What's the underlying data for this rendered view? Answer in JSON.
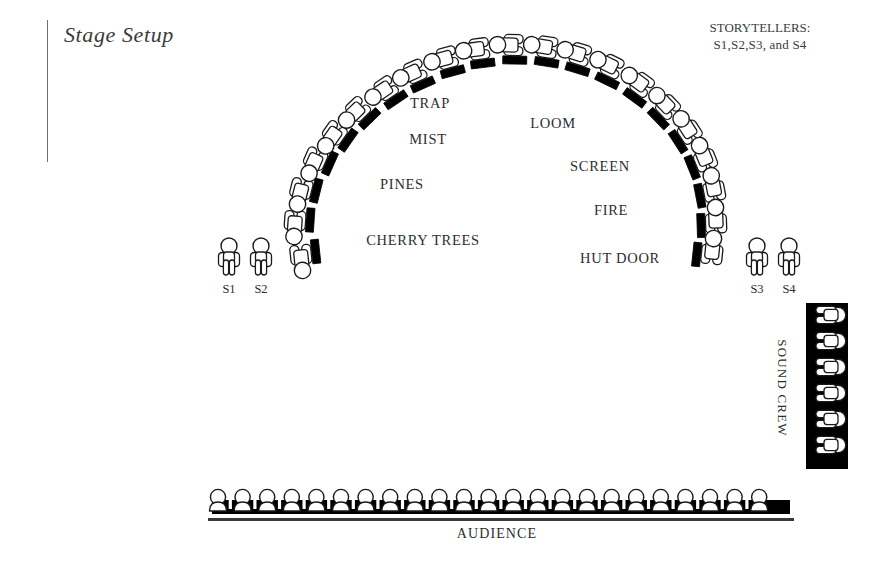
{
  "page": {
    "title": "Stage Setup",
    "background_color": "#ffffff",
    "width": 893,
    "height": 576
  },
  "header": {
    "title": "Stage Setup",
    "rule_color": "#6e6e6e"
  },
  "legend": {
    "storytellers_heading": "STORYTELLERS:",
    "storytellers_names": "S1,S2,S3, and S4"
  },
  "stage_labels": [
    {
      "id": "trap",
      "text": "TRAP",
      "x": 430,
      "y": 103
    },
    {
      "id": "loom",
      "text": "LOOM",
      "x": 553,
      "y": 123
    },
    {
      "id": "mist",
      "text": "MIST",
      "x": 428,
      "y": 139
    },
    {
      "id": "screen",
      "text": "SCREEN",
      "x": 600,
      "y": 166
    },
    {
      "id": "pines",
      "text": "PINES",
      "x": 402,
      "y": 184
    },
    {
      "id": "fire",
      "text": "FIRE",
      "x": 611,
      "y": 210
    },
    {
      "id": "cherry-trees",
      "text": "CHERRY TREES",
      "x": 423,
      "y": 240
    },
    {
      "id": "hut-door",
      "text": "HUT DOOR",
      "x": 620,
      "y": 258
    }
  ],
  "storyteller_markers": [
    {
      "id": "s1",
      "text": "S1",
      "x": 229,
      "y": 282
    },
    {
      "id": "s2",
      "text": "S2",
      "x": 261,
      "y": 282
    },
    {
      "id": "s3",
      "text": "S3",
      "x": 757,
      "y": 282
    },
    {
      "id": "s4",
      "text": "S4",
      "x": 789,
      "y": 282
    }
  ],
  "groups": {
    "audience": {
      "label": "AUDIENCE",
      "count": 23,
      "bench_color": "#000000",
      "figure_fill": "#ffffff",
      "outline_color": "#1a1a1a"
    },
    "sound_crew": {
      "label": "SOUND CREW",
      "count": 6,
      "panel_color": "#000000"
    },
    "performer_arc": {
      "count": 22,
      "description": "semicircular arc of seated performers"
    },
    "standing_storytellers": {
      "count": 4,
      "labels": [
        "S1",
        "S2",
        "S3",
        "S4"
      ]
    }
  },
  "arc_figures": [
    {
      "cx": 301,
      "cy": 256,
      "rot": -96
    },
    {
      "cx": 295,
      "cy": 222,
      "rot": -86
    },
    {
      "cx": 301,
      "cy": 190,
      "rot": -76
    },
    {
      "cx": 315,
      "cy": 160,
      "rot": -66
    },
    {
      "cx": 334,
      "cy": 134,
      "rot": -55
    },
    {
      "cx": 357,
      "cy": 110,
      "rot": -44
    },
    {
      "cx": 385,
      "cy": 89,
      "rot": -34
    },
    {
      "cx": 414,
      "cy": 72,
      "rot": -24
    },
    {
      "cx": 446,
      "cy": 58,
      "rot": -15
    },
    {
      "cx": 478,
      "cy": 49,
      "rot": -7
    },
    {
      "cx": 512,
      "cy": 45,
      "rot": 1
    },
    {
      "cx": 546,
      "cy": 47,
      "rot": 9
    },
    {
      "cx": 579,
      "cy": 54,
      "rot": 17
    },
    {
      "cx": 611,
      "cy": 66,
      "rot": 26
    },
    {
      "cx": 641,
      "cy": 84,
      "rot": 36
    },
    {
      "cx": 667,
      "cy": 106,
      "rot": 46
    },
    {
      "cx": 689,
      "cy": 131,
      "rot": 57
    },
    {
      "cx": 705,
      "cy": 159,
      "rot": 68
    },
    {
      "cx": 714,
      "cy": 190,
      "rot": 79
    },
    {
      "cx": 716,
      "cy": 222,
      "rot": 88
    },
    {
      "cx": 712,
      "cy": 253,
      "rot": 96
    }
  ],
  "standing_figures": [
    {
      "cx": 229,
      "cy": 258
    },
    {
      "cx": 261,
      "cy": 258
    },
    {
      "cx": 757,
      "cy": 258
    },
    {
      "cx": 789,
      "cy": 258
    }
  ],
  "audience_row": {
    "start_x": 218,
    "spacing": 24.6,
    "baseline_y": 512,
    "bench_x": 212,
    "bench_y": 500,
    "bench_width": 578,
    "bench_height": 14,
    "floor_y": 518
  },
  "sound_crew_panel": {
    "x": 806,
    "y": 303,
    "width": 42,
    "height": 166,
    "first_y": 315,
    "spacing": 26
  },
  "colors": {
    "ink": "#1a1a1a",
    "text": "#2e2e2e",
    "muted_text": "#3b3b3b",
    "paper": "#ffffff",
    "black_fill": "#000000"
  }
}
